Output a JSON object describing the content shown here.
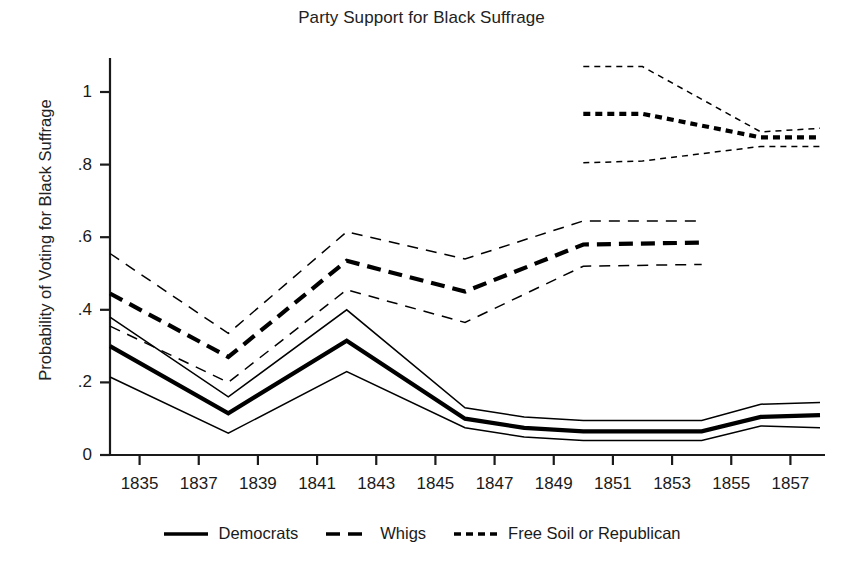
{
  "chart_data": {
    "type": "line",
    "title": "Party Support for Black Suffrage",
    "xlabel": "",
    "ylabel": "Probability of Voting for Black Suffrage",
    "xlim": [
      1834,
      1858
    ],
    "ylim": [
      0,
      1.12
    ],
    "grid": false,
    "legend_position": "bottom",
    "yticks": [
      "0",
      ".2",
      ".4",
      ".6",
      ".8",
      "1"
    ],
    "ytick_values": [
      0,
      0.2,
      0.4,
      0.6,
      0.8,
      1
    ],
    "xticks": [
      "1835",
      "1837",
      "1839",
      "1841",
      "1843",
      "1845",
      "1847",
      "1849",
      "1851",
      "1853",
      "1855",
      "1857"
    ],
    "xtick_values": [
      1835,
      1837,
      1839,
      1841,
      1843,
      1845,
      1847,
      1849,
      1851,
      1853,
      1855,
      1857
    ],
    "series": [
      {
        "name": "Democrats",
        "style": "solid",
        "color": "#000000",
        "x": [
          1834,
          1838,
          1842,
          1846,
          1848,
          1850,
          1854,
          1856,
          1858
        ],
        "values": [
          0.3,
          0.115,
          0.315,
          0.1,
          0.075,
          0.065,
          0.065,
          0.105,
          0.11
        ],
        "upper": [
          0.38,
          0.16,
          0.4,
          0.13,
          0.105,
          0.095,
          0.095,
          0.14,
          0.145
        ],
        "lower": [
          0.215,
          0.06,
          0.23,
          0.075,
          0.05,
          0.04,
          0.04,
          0.08,
          0.075
        ]
      },
      {
        "name": "Whigs",
        "style": "dashed",
        "color": "#000000",
        "x": [
          1834,
          1838,
          1842,
          1846,
          1850,
          1854
        ],
        "values": [
          0.445,
          0.27,
          0.535,
          0.45,
          0.58,
          0.585
        ],
        "upper": [
          0.555,
          0.335,
          0.615,
          0.54,
          0.645,
          0.645
        ],
        "lower": [
          0.355,
          0.2,
          0.455,
          0.365,
          0.52,
          0.525
        ]
      },
      {
        "name": "Free Soil or Republican",
        "style": "dotted",
        "color": "#000000",
        "x": [
          1850,
          1852,
          1856,
          1858
        ],
        "values": [
          0.94,
          0.94,
          0.875,
          0.875
        ],
        "upper": [
          1.07,
          1.07,
          0.89,
          0.9
        ],
        "lower": [
          0.805,
          0.81,
          0.85,
          0.85
        ]
      }
    ]
  },
  "legend": {
    "items": [
      {
        "label": "Democrats",
        "style": "solid"
      },
      {
        "label": "Whigs",
        "style": "dashed"
      },
      {
        "label": "Free Soil or Republican",
        "style": "dotted"
      }
    ]
  }
}
